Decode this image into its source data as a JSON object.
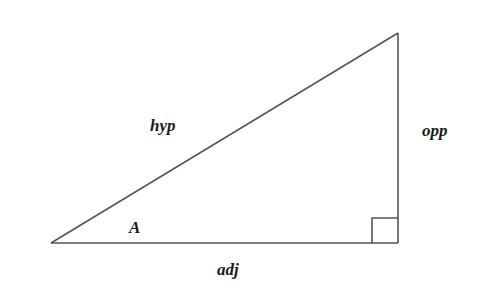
{
  "diagram": {
    "type": "right-triangle",
    "colors": {
      "stroke": "#555555",
      "text": "#1a1a1a",
      "background": "#ffffff"
    },
    "vertices": {
      "angle_a": [
        51,
        243
      ],
      "right_angle": [
        398,
        243
      ],
      "top": [
        398,
        33
      ]
    },
    "right_angle_marker_size": 26,
    "labels": {
      "angle": "A",
      "hypotenuse": "hyp",
      "opposite": "opp",
      "adjacent": "adj"
    }
  }
}
